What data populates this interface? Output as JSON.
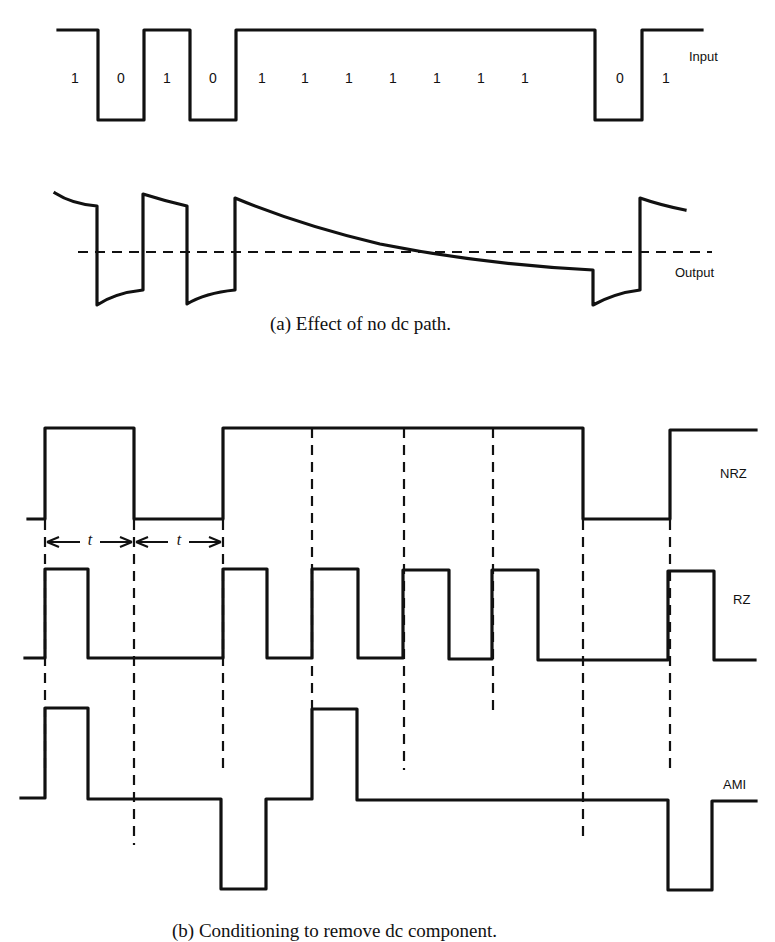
{
  "part_a": {
    "caption": "(a) Effect of no dc path.",
    "input_label": "Input",
    "output_label": "Output",
    "bits": [
      "1",
      "0",
      "1",
      "0",
      "1",
      "1",
      "1",
      "1",
      "1",
      "1",
      "1",
      "0",
      "1"
    ],
    "bit_x": [
      75,
      121,
      167,
      213,
      260,
      304,
      348,
      392,
      436,
      480,
      524,
      618,
      666
    ]
  },
  "part_b": {
    "caption": "(b) Conditioning to remove dc component.",
    "nrz_label": "NRZ",
    "rz_label": "RZ",
    "ami_label": "AMI",
    "bit_period_label": "t",
    "bits": [
      "1",
      "0",
      "1",
      "1",
      "1",
      "1",
      "1",
      "0",
      "1"
    ],
    "slot_boundaries_x": [
      45,
      134,
      223,
      312,
      404,
      493,
      583,
      670,
      756
    ]
  },
  "colors": {
    "ink": "#111111",
    "background": "#ffffff"
  }
}
